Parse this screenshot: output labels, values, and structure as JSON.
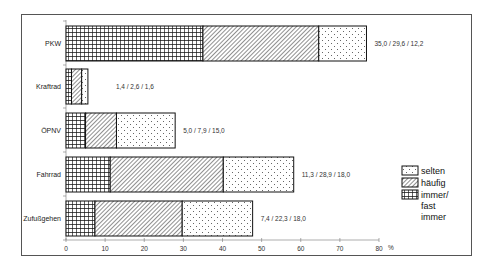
{
  "chart_data": {
    "type": "bar",
    "orientation": "horizontal",
    "stacked": true,
    "title": "",
    "xlabel": "%",
    "ylabel": "",
    "xlim": [
      0,
      80
    ],
    "x_ticks": [
      0,
      10,
      20,
      30,
      40,
      50,
      60,
      70,
      80
    ],
    "grid": false,
    "legend_position": "right",
    "categories": [
      "PKW",
      "Kraftrad",
      "ÖPNV",
      "Fahrrad",
      "Zufußgehen"
    ],
    "series": [
      {
        "name": "immer/ fast immer",
        "pattern": "grid",
        "values": [
          35.0,
          1.4,
          5.0,
          11.3,
          7.4
        ]
      },
      {
        "name": "häufig",
        "pattern": "diagonal-hatch",
        "values": [
          29.6,
          2.6,
          7.9,
          28.9,
          22.3
        ]
      },
      {
        "name": "selten",
        "pattern": "dots",
        "values": [
          12.2,
          1.6,
          15.0,
          18.0,
          18.0
        ]
      }
    ],
    "annotations": [
      "35,0 / 29,6 / 12,2",
      "1,4 / 2,6 / 1,6",
      "5,0 / 7,9 / 15,0",
      "11,3 / 28,9 / 18,0",
      "7,4 / 22,3 / 18,0"
    ]
  },
  "axis": {
    "unit_label": "%",
    "ticks": [
      "0",
      "10",
      "20",
      "30",
      "40",
      "50",
      "60",
      "70",
      "80"
    ]
  },
  "rows": [
    {
      "label": "PKW",
      "value_text": "35,0 / 29,6 / 12,2"
    },
    {
      "label": "Kraftrad",
      "value_text": "1,4 / 2,6 / 1,6"
    },
    {
      "label": "ÖPNV",
      "value_text": "5,0 / 7,9 / 15,0"
    },
    {
      "label": "Fahrrad",
      "value_text": "11,3 / 28,9 / 18,0"
    },
    {
      "label": "Zufußgehen",
      "value_text": "7,4 / 22,3 / 18,0"
    }
  ],
  "legend": {
    "items": [
      {
        "label": "selten",
        "pattern": "dots"
      },
      {
        "label": "häufig",
        "pattern": "diagonal-hatch"
      },
      {
        "label_line1": "immer/",
        "label_line2": "fast",
        "label_line3": "immer",
        "pattern": "grid"
      }
    ]
  },
  "colors": {
    "stroke": "#222222",
    "frame": "#555555",
    "background": "#ffffff"
  }
}
